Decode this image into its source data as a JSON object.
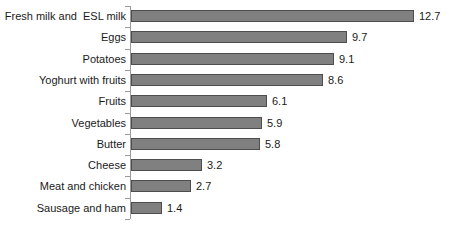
{
  "chart_data": {
    "type": "bar",
    "orientation": "horizontal",
    "title": "",
    "subtitle": "",
    "xlabel": "",
    "ylabel": "",
    "grid": false,
    "legend": null,
    "legend_position": "none",
    "axis": {
      "value_axis_visible": false,
      "category_axis_visible": true,
      "category_axis_ticks": true,
      "xlim": [
        0,
        12.7
      ]
    },
    "colors": {
      "bar_fill": "#808080",
      "bar_border": "#4d4d4d",
      "axis": "#9a9a9a",
      "text": "#1a1a1a",
      "background": "#ffffff"
    },
    "categories": [
      "Fresh milk and  ESL milk",
      "Eggs",
      "Potatoes",
      "Yoghurt with fruits",
      "Fruits",
      "Vegetables",
      "Butter",
      "Cheese",
      "Meat and chicken",
      "Sausage and ham"
    ],
    "values": [
      12.7,
      9.7,
      9.1,
      8.6,
      6.1,
      5.9,
      5.8,
      3.2,
      2.7,
      1.4
    ],
    "data_labels": [
      "12.7",
      "9.7",
      "9.1",
      "8.6",
      "6.1",
      "5.9",
      "5.8",
      "3.2",
      "2.7",
      "1.4"
    ]
  }
}
